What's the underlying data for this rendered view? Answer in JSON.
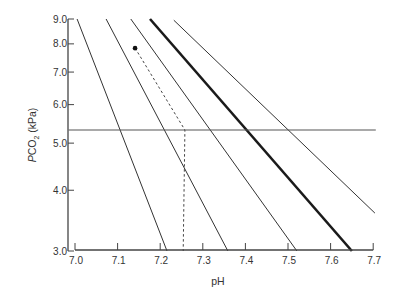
{
  "chart_data": {
    "type": "line",
    "title": "",
    "xlabel": "pH",
    "ylabel": "PCO2 (kPa)",
    "ylabel_parts": {
      "italic": "P",
      "main": "CO",
      "sub": "2",
      "unit": " (kPa)"
    },
    "xlim": [
      7.0,
      7.7
    ],
    "ylim": [
      3.0,
      9.0
    ],
    "yscale": "log",
    "grid": false,
    "legend": null,
    "x_ticks": [
      7.0,
      7.1,
      7.2,
      7.3,
      7.4,
      7.5,
      7.6,
      7.7
    ],
    "x_tick_labels": [
      "7.0",
      "7.1",
      "7.2",
      "7.3",
      "7.4",
      "7.5",
      "7.6",
      "7.7"
    ],
    "y_ticks": [
      3.0,
      4.0,
      5.0,
      6.0,
      7.0,
      8.0,
      9.0
    ],
    "y_tick_labels": [
      "3.0",
      "4.0",
      "5.0",
      "6.0",
      "7.0",
      "8.0",
      "9.0"
    ],
    "series": [
      {
        "name": "isopleth-1",
        "style": "thin",
        "points": [
          [
            7.005,
            9.0
          ],
          [
            7.216,
            3.0
          ]
        ]
      },
      {
        "name": "isopleth-2",
        "style": "thin",
        "points": [
          [
            7.073,
            9.0
          ],
          [
            7.359,
            3.0
          ]
        ]
      },
      {
        "name": "isopleth-3",
        "style": "thin",
        "points": [
          [
            7.131,
            9.0
          ],
          [
            7.521,
            3.0
          ]
        ]
      },
      {
        "name": "isopleth-normal",
        "style": "bold",
        "points": [
          [
            7.176,
            9.0
          ],
          [
            7.65,
            3.0
          ]
        ]
      },
      {
        "name": "isopleth-5",
        "style": "thin",
        "points": [
          [
            7.232,
            8.95
          ],
          [
            7.704,
            3.59
          ]
        ]
      },
      {
        "name": "normal-pco2-reference",
        "style": "horizontal",
        "points": [
          [
            6.985,
            5.32
          ],
          [
            7.706,
            5.32
          ]
        ]
      },
      {
        "name": "patient-path",
        "style": "dashed",
        "points": [
          [
            7.141,
            7.84
          ],
          [
            7.258,
            5.32
          ],
          [
            7.254,
            3.0
          ]
        ]
      }
    ],
    "annotations": [
      {
        "type": "point",
        "x": 7.141,
        "y": 7.84,
        "label": ""
      }
    ]
  }
}
